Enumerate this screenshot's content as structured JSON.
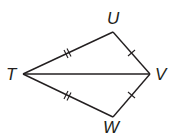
{
  "diagram": {
    "type": "geometry-kite",
    "vertices": {
      "T": {
        "label": "T",
        "x": 23,
        "y": 74
      },
      "U": {
        "label": "U",
        "x": 113,
        "y": 32
      },
      "V": {
        "label": "V",
        "x": 150,
        "y": 74
      },
      "W": {
        "label": "W",
        "x": 113,
        "y": 117
      }
    },
    "segments": [
      {
        "from": "T",
        "to": "U",
        "tick_marks": 2
      },
      {
        "from": "U",
        "to": "V",
        "tick_marks": 1
      },
      {
        "from": "V",
        "to": "W",
        "tick_marks": 1
      },
      {
        "from": "W",
        "to": "T",
        "tick_marks": 2
      },
      {
        "from": "T",
        "to": "V",
        "tick_marks": 0
      }
    ],
    "line_color": "#231f20"
  }
}
